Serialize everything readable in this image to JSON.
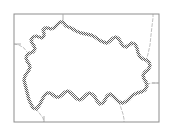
{
  "figure": {
    "type": "administrative_boundary_map",
    "width": 173,
    "height": 135,
    "background_color": "#ffffff",
    "title": "",
    "caption": "",
    "labels": []
  },
  "frame": {
    "name": "map-frame",
    "x": 14,
    "y": 14,
    "width": 145,
    "height": 108,
    "stroke_color": "#8d8d8d",
    "stroke_width": 1,
    "fill": "none"
  },
  "frame_ticks": [
    {
      "name": "tick-top",
      "x1": 63,
      "y1": 14,
      "x2": 63,
      "y2": 20
    },
    {
      "name": "tick-bottom",
      "x1": 44,
      "y1": 116,
      "x2": 44,
      "y2": 122
    },
    {
      "name": "tick-left",
      "x1": 14,
      "y1": 44,
      "x2": 21,
      "y2": 44
    },
    {
      "name": "tick-right",
      "x1": 152,
      "y1": 83,
      "x2": 159,
      "y2": 83
    }
  ],
  "main_boundary": {
    "name": "primary-administrative-boundary",
    "stroke_color": "#6b6b6b",
    "stroke_width": 3.4,
    "fill": "#ffffff",
    "pattern": "dithered-gray-band",
    "closed": true,
    "points": [
      [
        63,
        22
      ],
      [
        66,
        26
      ],
      [
        71,
        28
      ],
      [
        76,
        31
      ],
      [
        81,
        33
      ],
      [
        86,
        34
      ],
      [
        91,
        35
      ],
      [
        95,
        37
      ],
      [
        99,
        40
      ],
      [
        103,
        42
      ],
      [
        107,
        43
      ],
      [
        110,
        41
      ],
      [
        113,
        38
      ],
      [
        116,
        37
      ],
      [
        119,
        39
      ],
      [
        121,
        43
      ],
      [
        123,
        46
      ],
      [
        126,
        47
      ],
      [
        129,
        45
      ],
      [
        132,
        43
      ],
      [
        135,
        44
      ],
      [
        137,
        48
      ],
      [
        138,
        53
      ],
      [
        140,
        57
      ],
      [
        143,
        59
      ],
      [
        146,
        60
      ],
      [
        149,
        62
      ],
      [
        150,
        66
      ],
      [
        148,
        70
      ],
      [
        145,
        72
      ],
      [
        143,
        75
      ],
      [
        144,
        79
      ],
      [
        146,
        82
      ],
      [
        147,
        86
      ],
      [
        145,
        90
      ],
      [
        141,
        92
      ],
      [
        137,
        93
      ],
      [
        133,
        95
      ],
      [
        130,
        98
      ],
      [
        127,
        101
      ],
      [
        123,
        103
      ],
      [
        119,
        102
      ],
      [
        116,
        99
      ],
      [
        113,
        96
      ],
      [
        110,
        94
      ],
      [
        107,
        96
      ],
      [
        105,
        100
      ],
      [
        103,
        103
      ],
      [
        100,
        104
      ],
      [
        97,
        101
      ],
      [
        95,
        97
      ],
      [
        92,
        94
      ],
      [
        89,
        93
      ],
      [
        86,
        95
      ],
      [
        83,
        98
      ],
      [
        80,
        100
      ],
      [
        77,
        99
      ],
      [
        74,
        96
      ],
      [
        71,
        93
      ],
      [
        68,
        91
      ],
      [
        65,
        92
      ],
      [
        62,
        95
      ],
      [
        59,
        97
      ],
      [
        56,
        97
      ],
      [
        53,
        95
      ],
      [
        50,
        93
      ],
      [
        47,
        93
      ],
      [
        44,
        96
      ],
      [
        42,
        100
      ],
      [
        40,
        104
      ],
      [
        38,
        107
      ],
      [
        36,
        109
      ],
      [
        33,
        108
      ],
      [
        31,
        104
      ],
      [
        29,
        100
      ],
      [
        28,
        96
      ],
      [
        27,
        92
      ],
      [
        26,
        88
      ],
      [
        25,
        84
      ],
      [
        24,
        80
      ],
      [
        25,
        76
      ],
      [
        27,
        73
      ],
      [
        29,
        70
      ],
      [
        30,
        67
      ],
      [
        29,
        64
      ],
      [
        27,
        61
      ],
      [
        26,
        58
      ],
      [
        27,
        55
      ],
      [
        30,
        53
      ],
      [
        33,
        52
      ],
      [
        35,
        49
      ],
      [
        34,
        46
      ],
      [
        32,
        43
      ],
      [
        31,
        40
      ],
      [
        33,
        37
      ],
      [
        36,
        36
      ],
      [
        39,
        37
      ],
      [
        42,
        38
      ],
      [
        44,
        36
      ],
      [
        44,
        33
      ],
      [
        43,
        30
      ],
      [
        45,
        28
      ],
      [
        48,
        28
      ],
      [
        51,
        29
      ],
      [
        54,
        28
      ],
      [
        56,
        26
      ],
      [
        58,
        24
      ],
      [
        60,
        22
      ]
    ]
  },
  "neighbor_boundaries": [
    {
      "name": "neighbor-boundary-northeast",
      "stroke_color": "#b8b8b8",
      "stroke_width": 0.9,
      "dash": "3 2",
      "points": [
        [
          146,
          61
        ],
        [
          148,
          54
        ],
        [
          150,
          45
        ],
        [
          151,
          35
        ],
        [
          152,
          26
        ],
        [
          153,
          18
        ],
        [
          153,
          14
        ]
      ]
    },
    {
      "name": "neighbor-boundary-west",
      "stroke_color": "#b8b8b8",
      "stroke_width": 0.9,
      "dash": "3 2",
      "points": [
        [
          14,
          44
        ],
        [
          19,
          45
        ],
        [
          24,
          48
        ],
        [
          27,
          52
        ]
      ]
    },
    {
      "name": "neighbor-boundary-east",
      "stroke_color": "#b8b8b8",
      "stroke_width": 0.9,
      "dash": "3 2",
      "points": [
        [
          147,
          84
        ],
        [
          152,
          83
        ],
        [
          156,
          83
        ],
        [
          159,
          83
        ]
      ]
    },
    {
      "name": "neighbor-boundary-south",
      "stroke_color": "#b8b8b8",
      "stroke_width": 0.9,
      "dash": "3 2",
      "points": [
        [
          119,
          102
        ],
        [
          121,
          108
        ],
        [
          123,
          114
        ],
        [
          124,
          119
        ],
        [
          124,
          122
        ]
      ]
    },
    {
      "name": "neighbor-boundary-southwest",
      "stroke_color": "#b8b8b8",
      "stroke_width": 0.9,
      "dash": "3 2",
      "points": [
        [
          36,
          109
        ],
        [
          40,
          114
        ],
        [
          43,
          118
        ],
        [
          44,
          122
        ]
      ]
    }
  ]
}
